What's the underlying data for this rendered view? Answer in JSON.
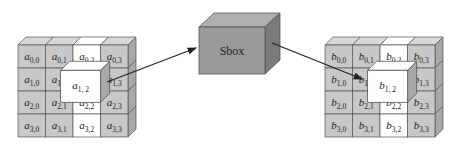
{
  "diagram": {
    "input_state": {
      "symbol": "a",
      "rows": [
        [
          "0,0",
          "0,1",
          "0,2",
          "0,3"
        ],
        [
          "1,0",
          "1,1",
          "1,2",
          "1,3"
        ],
        [
          "2,0",
          "2,1",
          "2,2",
          "2,3"
        ],
        [
          "3,0",
          "3,1",
          "3,2",
          "3,3"
        ]
      ],
      "highlighted_cell": "1,2",
      "highlighted_label": "1, 2"
    },
    "sbox": {
      "label": "Sbox"
    },
    "output_state": {
      "symbol": "b",
      "rows": [
        [
          "0,0",
          "0,1",
          "0,2",
          "0,3"
        ],
        [
          "1,0",
          "1,1",
          "1,2",
          "1,3"
        ],
        [
          "2,0",
          "2,1",
          "2,2",
          "2,3"
        ],
        [
          "3,0",
          "3,1",
          "3,2",
          "3,3"
        ]
      ],
      "highlighted_cell": "1,2",
      "highlighted_label": "1, 2"
    },
    "colors": {
      "cell_fill": "#c8c8c8",
      "cell_top": "#d8d8d8",
      "cell_side": "#a8a8a8",
      "highlight_fill": "#ffffff",
      "sbox_front": "#9a9a9a",
      "sbox_top": "#b0b0b0",
      "sbox_side": "#7a7a7a",
      "stroke": "#555555",
      "arrow": "#222222"
    }
  }
}
